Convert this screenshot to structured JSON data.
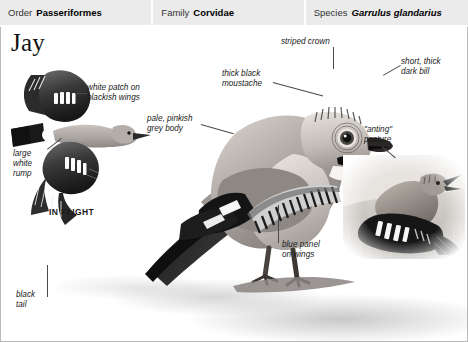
{
  "taxonomy": {
    "order": {
      "key": "Order",
      "value": "Passeriformes"
    },
    "family": {
      "key": "Family",
      "value": "Corvidae"
    },
    "species": {
      "key": "Species",
      "value": "Garrulus glandarius"
    }
  },
  "plate": {
    "title": "Jay",
    "annotations": {
      "white_patch": "white patch on\nblackish wings",
      "large_white_rump": "large\nwhite\nrump",
      "in_flight": "IN FLIGHT",
      "striped_crown": "striped crown",
      "thick_black_moustache": "thick black\nmoustache",
      "short_thick_dark_bill": "short, thick\ndark bill",
      "pale_pinkish_grey_body": "pale, pinkish\ngrey body",
      "anting_posture": "\"anting\"\nposture",
      "blue_panel_on_wings": "blue panel\non wings",
      "black_tail": "black\ntail"
    }
  },
  "colors": {
    "header_bg": "#ebebeb",
    "frame_border": "#b9b9b9",
    "text": "#1a1a1a",
    "leader_line": "#4a4a4a"
  }
}
